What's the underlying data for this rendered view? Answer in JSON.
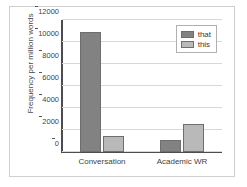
{
  "chart_data": {
    "type": "bar",
    "title": "",
    "xlabel": "",
    "ylabel": "Frequency per million words",
    "categories": [
      "Conversation",
      "Academic WR"
    ],
    "series": [
      {
        "name": "that",
        "values": [
          10900,
          1100
        ],
        "color": "#828282"
      },
      {
        "name": "this",
        "values": [
          1500,
          2550
        ],
        "color": "#b9b9b9"
      }
    ],
    "ylim": [
      0,
      12000
    ],
    "yticks": [
      0,
      2000,
      4000,
      6000,
      8000,
      10000,
      12000
    ],
    "ytick_labels": [
      "0",
      "2000",
      "4000",
      "6000",
      "8000",
      "10000",
      "12000"
    ],
    "grid": true,
    "legend_position": "top-right"
  },
  "legend": {
    "entries": [
      {
        "label": "that"
      },
      {
        "label": "this"
      }
    ]
  }
}
